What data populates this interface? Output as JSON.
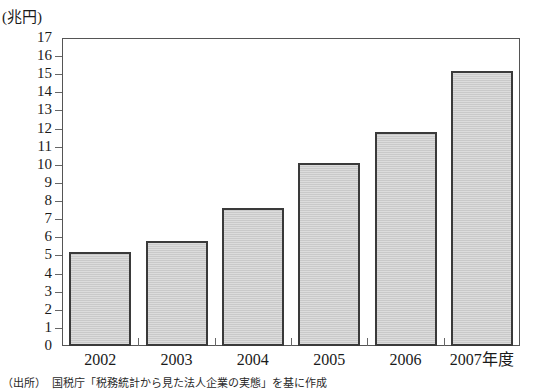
{
  "chart_data": {
    "type": "bar",
    "title": "",
    "xlabel": "",
    "ylabel": "(兆円)",
    "unit_label": "(兆円)",
    "categories": [
      "2002",
      "2003",
      "2004",
      "2005",
      "2006",
      "2007年度"
    ],
    "values": [
      5.2,
      5.8,
      7.6,
      10.1,
      11.8,
      15.2
    ],
    "ylim": [
      0,
      17
    ],
    "ytick_labels": [
      "0",
      "1",
      "2",
      "3",
      "4",
      "5",
      "6",
      "7",
      "8",
      "9",
      "10",
      "11",
      "12",
      "13",
      "14",
      "15",
      "16",
      "17"
    ],
    "ytick_values": [
      0,
      1,
      2,
      3,
      4,
      5,
      6,
      7,
      8,
      9,
      10,
      11,
      12,
      13,
      14,
      15,
      16,
      17
    ],
    "grid": false,
    "legend": null,
    "series": [
      {
        "name": "",
        "values": [
          5.2,
          5.8,
          7.6,
          10.1,
          11.8,
          15.2
        ]
      }
    ],
    "bar_fill_color": "#c9c9c9",
    "bar_border_color": "#3a3a3a",
    "axis_color": "#555555"
  },
  "figure": {
    "source_note": "（出所）　国税庁「税務統計から見た法人企業の実態」を基に作成"
  }
}
